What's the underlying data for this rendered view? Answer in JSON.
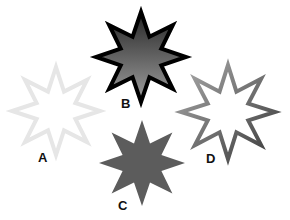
{
  "stars": [
    {
      "id": "A",
      "label": "A",
      "cx": 56,
      "cy": 111,
      "r_outer": 44,
      "r_inner": 21,
      "style": "light-outline",
      "fill": "#ffffff",
      "stroke": "#e6e6e6",
      "stroke_width": 4,
      "label_x": 38,
      "label_y": 151
    },
    {
      "id": "B",
      "label": "B",
      "cx": 141,
      "cy": 57,
      "r_outer": 45,
      "r_inner": 22,
      "style": "dark-gradient-black-outline",
      "fill_top": "#2b2b2b",
      "fill_bottom": "#9a9a9a",
      "stroke": "#000000",
      "stroke_width": 4,
      "label_x": 121,
      "label_y": 97
    },
    {
      "id": "C",
      "label": "C",
      "cx": 142,
      "cy": 163,
      "r_outer": 43,
      "r_inner": 21,
      "style": "solid-gray",
      "fill": "#5c5c5c",
      "stroke": "none",
      "stroke_width": 0,
      "label_x": 118,
      "label_y": 199
    },
    {
      "id": "D",
      "label": "D",
      "cx": 228,
      "cy": 112,
      "r_outer": 47,
      "r_inner": 22,
      "style": "gradient-outline",
      "fill": "#ffffff",
      "stroke_start": "#9a9a9a",
      "stroke_end": "#444444",
      "stroke_width": 4,
      "label_x": 206,
      "label_y": 152
    }
  ]
}
